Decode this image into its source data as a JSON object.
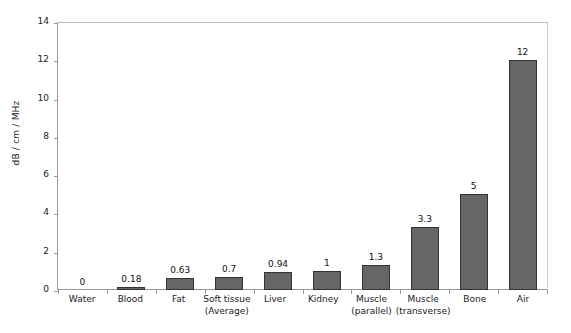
{
  "chart_data": {
    "type": "bar",
    "title": "",
    "xlabel": "",
    "ylabel": "dB / cm / MHz",
    "ylim": [
      0,
      14
    ],
    "ytick_values": [
      14,
      12,
      10,
      8,
      6,
      4,
      2,
      0
    ],
    "yticks": [
      "14",
      "12",
      "10",
      "8",
      "6",
      "4",
      "2",
      "0"
    ],
    "grid": false,
    "legend": false,
    "bar_color": "#666666",
    "bar_edge_color": "#333333",
    "background": "#ffffff",
    "categories": [
      "Water",
      "Blood",
      "Fat",
      "Soft tissue (Average)",
      "Liver",
      "Kidney",
      "Muscle (parallel)",
      "Muscle (transverse)",
      "Bone",
      "Air"
    ],
    "category_lines": [
      {
        "line1": "Water",
        "line2": ""
      },
      {
        "line1": "Blood",
        "line2": ""
      },
      {
        "line1": "Fat",
        "line2": ""
      },
      {
        "line1": "Soft tissue",
        "line2": "(Average)"
      },
      {
        "line1": "Liver",
        "line2": ""
      },
      {
        "line1": "Kidney",
        "line2": ""
      },
      {
        "line1": "Muscle",
        "line2": "(parallel)"
      },
      {
        "line1": "Muscle",
        "line2": "(transverse)"
      },
      {
        "line1": "Bone",
        "line2": ""
      },
      {
        "line1": "Air",
        "line2": ""
      }
    ],
    "values": [
      0,
      0.18,
      0.63,
      0.7,
      0.94,
      1,
      1.3,
      3.3,
      5,
      12
    ],
    "value_labels": [
      "0",
      "0.18",
      "0.63",
      "0.7",
      "0.94",
      "1",
      "1.3",
      "3.3",
      "5",
      "12"
    ]
  }
}
